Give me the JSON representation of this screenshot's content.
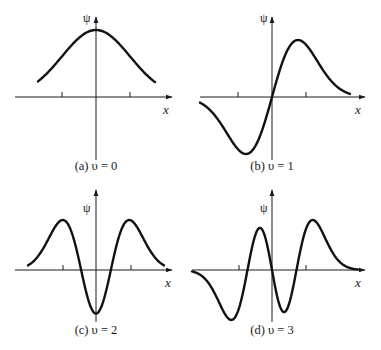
{
  "figure": {
    "x_axis_label": "x",
    "y_axis_label": "ψ",
    "colors": {
      "curve": "#111111",
      "axis": "#1a1a1a",
      "background": "#ffffff"
    }
  },
  "panels": [
    {
      "id": "a",
      "caption": "(a) υ = 0",
      "quantum_number": 0
    },
    {
      "id": "b",
      "caption": "(b) υ = 1",
      "quantum_number": 1
    },
    {
      "id": "c",
      "caption": "(c) υ = 2",
      "quantum_number": 2
    },
    {
      "id": "d",
      "caption": "(d) υ = 3",
      "quantum_number": 3
    }
  ],
  "chart_data": [
    {
      "type": "line",
      "title": "(a) υ = 0",
      "xlabel": "x",
      "ylabel": "ψ",
      "description": "Harmonic oscillator wavefunction, ground state: Gaussian, even, no nodes",
      "x_ticks": 2,
      "grid": false,
      "shape": "single positive maximum at x = 0"
    },
    {
      "type": "line",
      "title": "(b) υ = 1",
      "xlabel": "x",
      "ylabel": "ψ",
      "description": "First excited state: odd, one node at x = 0",
      "x_ticks": 2,
      "grid": false,
      "shape": "negative minimum at x < 0, positive maximum at x > 0"
    },
    {
      "type": "line",
      "title": "(c) υ = 2",
      "xlabel": "x",
      "ylabel": "ψ",
      "description": "Second excited state: even, two nodes",
      "x_ticks": 2,
      "grid": false,
      "shape": "two positive maxima, negative minimum at x = 0"
    },
    {
      "type": "line",
      "title": "(d) υ = 3",
      "xlabel": "x",
      "ylabel": "ψ",
      "description": "Third excited state: odd, three nodes (one at x = 0)",
      "x_ticks": 2,
      "grid": false,
      "shape": "alternating min, max, min, max from left to right"
    }
  ]
}
